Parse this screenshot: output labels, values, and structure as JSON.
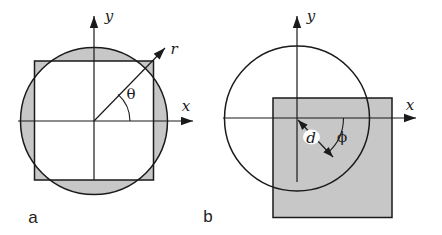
{
  "colors": {
    "background": "#ffffff",
    "line": "#1a1a1a",
    "shade": "#c7c7c7",
    "label_halo": "#ffffff",
    "caption": "#222222"
  },
  "panels": [
    {
      "caption": "a",
      "x_label": "x",
      "y_label": "y",
      "radius_label": "r",
      "angle_label": "θ",
      "content": "circle and square concentric at origin, symmetric difference shaded, polar ray r at angle θ from x-axis"
    },
    {
      "caption": "b",
      "x_label": "x",
      "y_label": "y",
      "distance_label": "d",
      "angle_label": "ϕ",
      "content": "circle centered at origin, shaded square offset down-right; double arrow d from circle center to square center at angle ϕ below x-axis"
    }
  ]
}
